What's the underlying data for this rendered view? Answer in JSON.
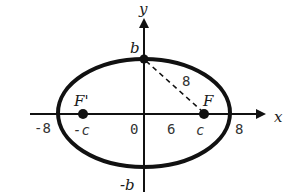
{
  "diagram": {
    "type": "ellipse-foci",
    "axes": {
      "x_label": "x",
      "y_label": "y"
    },
    "ellipse": {
      "center": [
        0,
        0
      ],
      "semi_major": 8,
      "semi_minor": "b"
    },
    "points": {
      "top_vertex_label": "b",
      "bottom_vertex_label": "-b",
      "focus_right_label": "F",
      "focus_left_label": "F'",
      "focus_right_coord_label": "c",
      "focus_left_coord_label": "-c"
    },
    "tick_labels": {
      "left_vertex": "-8",
      "origin": "0",
      "c_value": "6",
      "right_vertex": "8"
    },
    "segment": {
      "from": "b",
      "to": "F",
      "style": "dashed",
      "length_label": "8"
    },
    "colors": {
      "stroke": "#111111",
      "background": "#ffffff"
    }
  }
}
